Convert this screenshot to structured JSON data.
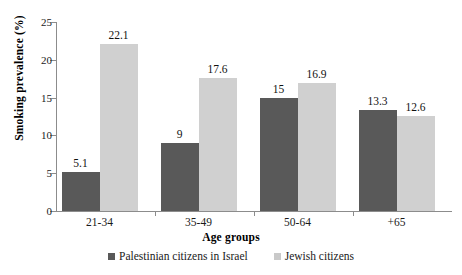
{
  "chart_data": {
    "type": "bar",
    "title": "",
    "subtitle": "",
    "xlabel": "Age groups",
    "ylabel": "Smoking prevalence (%)",
    "categories": [
      "21-34",
      "35-49",
      "50-64",
      "+65"
    ],
    "series": [
      {
        "name": "Palestinian citizens in Israel",
        "color": "#595959",
        "values": [
          5.1,
          9,
          15,
          13.3
        ],
        "labels": [
          "5.1",
          "9",
          "15",
          "13.3"
        ]
      },
      {
        "name": "Jewish citizens",
        "color": "#d0d0d0",
        "values": [
          22.1,
          17.6,
          16.9,
          12.6
        ],
        "labels": [
          "22.1",
          "17.6",
          "16.9",
          "12.6"
        ]
      }
    ],
    "ylim": [
      0,
      25
    ],
    "yticks": [
      0,
      5,
      10,
      15,
      20,
      25
    ],
    "ytick_labels": [
      "0",
      "5",
      "10",
      "15",
      "20",
      "25"
    ],
    "grid": false,
    "legend_position": "bottom-center",
    "axis_color": "#8c8c8c",
    "background": "#ffffff"
  }
}
